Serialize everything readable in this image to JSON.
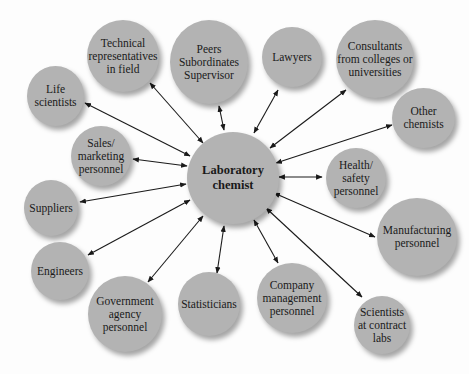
{
  "diagram": {
    "type": "hub-and-spoke",
    "center": {
      "label": "Laboratory\nchemist"
    },
    "nodes": [
      {
        "id": "technical-representatives",
        "label": "Technical\nrepresentatives\nin field"
      },
      {
        "id": "peers",
        "label": "Peers\nSubordinates\nSupervisor"
      },
      {
        "id": "lawyers",
        "label": "Lawyers"
      },
      {
        "id": "consultants",
        "label": "Consultants\nfrom colleges or\nuniversities"
      },
      {
        "id": "life-scientists",
        "label": "Life\nscientists"
      },
      {
        "id": "other-chemists",
        "label": "Other\nchemists"
      },
      {
        "id": "sales-marketing",
        "label": "Sales/\nmarketing\npersonnel"
      },
      {
        "id": "health-safety",
        "label": "Health/\nsafety\npersonnel"
      },
      {
        "id": "suppliers",
        "label": "Suppliers"
      },
      {
        "id": "manufacturing",
        "label": "Manufacturing\npersonnel"
      },
      {
        "id": "engineers",
        "label": "Engineers"
      },
      {
        "id": "government",
        "label": "Government\nagency\npersonnel"
      },
      {
        "id": "statisticians",
        "label": "Statisticians"
      },
      {
        "id": "company-management",
        "label": "Company\nmanagement\npersonnel"
      },
      {
        "id": "scientists-contract-labs",
        "label": "Scientists\nat contract\nlabs"
      }
    ],
    "edges": "bidirectional arrows from center to every node",
    "colors": {
      "node_fill": "#b3b3b3",
      "arrow": "#1a1a1a",
      "background": "#fdfdfd"
    }
  }
}
